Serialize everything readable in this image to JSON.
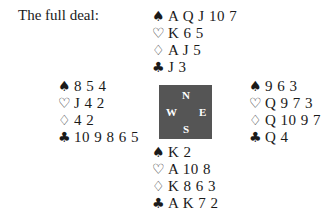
{
  "title": "The full deal:",
  "suits": {
    "spades": "♠",
    "hearts": "♡",
    "diamonds": "♢",
    "clubs": "♣"
  },
  "compass": {
    "north": "N",
    "south": "S",
    "west": "W",
    "east": "E",
    "background_color": "#555555"
  },
  "hands": {
    "north": {
      "spades": "A Q J 10 7",
      "hearts": "K 6 5",
      "diamonds": "A J 5",
      "clubs": "J 3"
    },
    "west": {
      "spades": "8 5 4",
      "hearts": "J 4 2",
      "diamonds": "4 2",
      "clubs": "10 9 8 6 5"
    },
    "east": {
      "spades": "9 6 3",
      "hearts": "Q 9 7 3",
      "diamonds": "Q 10 9 7",
      "clubs": "Q 4"
    },
    "south": {
      "spades": "K 2",
      "hearts": "A 10 8",
      "diamonds": "K 8 6 3",
      "clubs": "A K 7 2"
    }
  }
}
